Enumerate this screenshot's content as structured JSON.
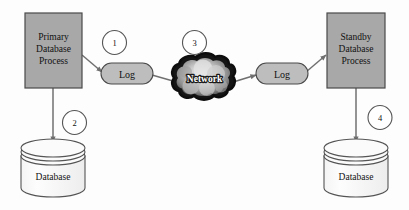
{
  "diagram": {
    "background_color": "#fdfdfd",
    "nodes": {
      "primary_process": {
        "label_line1": "Primary",
        "label_line2": "Database",
        "label_line3": "Process",
        "fill": "#a8a8a8",
        "stroke": "#4a4a4a"
      },
      "standby_process": {
        "label_line1": "Standby",
        "label_line2": "Database",
        "label_line3": "Process",
        "fill": "#a8a8a8",
        "stroke": "#4a4a4a"
      },
      "primary_database": {
        "label": "Database",
        "fill": "#fbfbfb",
        "stroke": "#555555"
      },
      "standby_database": {
        "label": "Database",
        "fill": "#fbfbfb",
        "stroke": "#555555"
      },
      "log_left": {
        "label": "Log",
        "fill": "#bdbdbd",
        "stroke": "#4a4a4a"
      },
      "log_right": {
        "label": "Log",
        "fill": "#bdbdbd",
        "stroke": "#4a4a4a"
      },
      "network_cloud": {
        "label": "Network",
        "fill": "#1a1a1a",
        "text_color": "#ffffff"
      }
    },
    "steps": [
      {
        "number": "1",
        "stroke": "#555555"
      },
      {
        "number": "2",
        "stroke": "#555555"
      },
      {
        "number": "3",
        "stroke": "#555555"
      },
      {
        "number": "4",
        "stroke": "#555555"
      }
    ],
    "connectors": {
      "stroke": "#707070",
      "arrow_fill": "#707070"
    }
  }
}
